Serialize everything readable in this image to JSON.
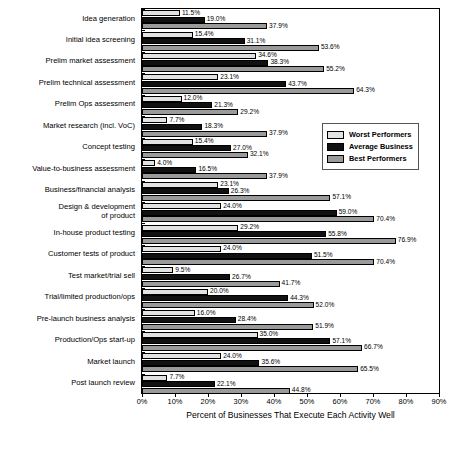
{
  "chart_data": {
    "type": "bar",
    "orientation": "horizontal",
    "title": "",
    "xlabel": "Percent of Businesses That Execute Each Activity Well",
    "ylabel": "",
    "xlim": [
      0,
      90
    ],
    "xticks": [
      "0%",
      "10%",
      "20%",
      "30%",
      "40%",
      "50%",
      "60%",
      "70%",
      "80%",
      "90%"
    ],
    "grid": false,
    "legend_position": "right-middle",
    "categories": [
      "Idea generation",
      "Initial idea screening",
      "Prelim market assessment",
      "Prelim technical assessment",
      "Prelim Ops assessment",
      "Market research (incl. VoC)",
      "Concept testing",
      "Value-to-business assessment",
      "Business/financial analysis",
      "Design & development\nof product",
      "In-house product testing",
      "Customer tests of product",
      "Test market/trial sell",
      "Trial/limited production/ops",
      "Pre-launch business analysis",
      "Production/Ops start-up",
      "Market launch",
      "Post launch review"
    ],
    "series": [
      {
        "name": "Worst Performers",
        "color": "#e2e2e2",
        "values": [
          11.5,
          15.4,
          34.6,
          23.1,
          12.0,
          7.7,
          15.4,
          4.0,
          23.1,
          24.0,
          29.2,
          24.0,
          9.5,
          20.0,
          16.0,
          35.0,
          24.0,
          7.7
        ],
        "labels": [
          "11.5%",
          "15.4%",
          "34.6%",
          "23.1%",
          "12.0%",
          "7.7%",
          "15.4%",
          "4.0%",
          "23.1%",
          "24.0%",
          "29.2%",
          "24.0%",
          "9.5%",
          "20.0%",
          "16.0%",
          "35.0%",
          "24.0%",
          "7.7%"
        ]
      },
      {
        "name": "Average Business",
        "color": "#111111",
        "values": [
          19.0,
          31.1,
          38.3,
          43.7,
          21.3,
          18.3,
          27.0,
          16.5,
          26.3,
          59.0,
          55.8,
          51.5,
          26.7,
          44.3,
          28.4,
          57.1,
          35.6,
          22.1
        ],
        "labels": [
          "19.0%",
          "31.1%",
          "38.3%",
          "43.7%",
          "21.3%",
          "18.3%",
          "27.0%",
          "16.5%",
          "26.3%",
          "59.0%",
          "55.8%",
          "51.5%",
          "26.7%",
          "44.3%",
          "28.4%",
          "57.1%",
          "35.6%",
          "22.1%"
        ]
      },
      {
        "name": "Best Performers",
        "color": "#9a9a9a",
        "values": [
          37.9,
          53.6,
          55.2,
          64.3,
          29.2,
          37.9,
          32.1,
          37.9,
          57.1,
          70.4,
          76.9,
          70.4,
          41.7,
          52.0,
          51.9,
          66.7,
          65.5,
          44.8
        ],
        "labels": [
          "37.9%",
          "53.6%",
          "55.2%",
          "64.3%",
          "29.2%",
          "37.9%",
          "32.1%",
          "37.9%",
          "57.1%",
          "70.4%",
          "76.9%",
          "70.4%",
          "41.7%",
          "52.0%",
          "51.9%",
          "66.7%",
          "65.5%",
          "44.8%"
        ]
      }
    ]
  },
  "legend": {
    "items": [
      {
        "label": "Worst Performers",
        "swatch": "worst"
      },
      {
        "label": "Average Business",
        "swatch": "avg"
      },
      {
        "label": "Best Performers",
        "swatch": "best"
      }
    ]
  }
}
